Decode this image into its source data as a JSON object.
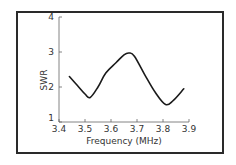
{
  "chart_data": {
    "type": "line",
    "title": "",
    "xlabel": "Frequency (MHz)",
    "ylabel": "SWR",
    "xlim": [
      3.4,
      3.9
    ],
    "ylim": [
      1,
      4
    ],
    "xticks": [
      "3.4",
      "3.5",
      "3.6",
      "3.7",
      "3.8",
      "3.9"
    ],
    "yticks": [
      "1",
      "2",
      "3",
      "4"
    ],
    "grid": false,
    "legend": null,
    "series": [
      {
        "name": "SWR",
        "x": [
          3.44,
          3.47,
          3.5,
          3.52,
          3.55,
          3.58,
          3.62,
          3.65,
          3.67,
          3.69,
          3.73,
          3.77,
          3.81,
          3.84,
          3.88
        ],
        "y": [
          2.3,
          2.05,
          1.8,
          1.7,
          2.0,
          2.4,
          2.7,
          2.92,
          2.97,
          2.88,
          2.35,
          1.85,
          1.5,
          1.62,
          1.95
        ]
      }
    ],
    "color": "#1a1a1a"
  }
}
